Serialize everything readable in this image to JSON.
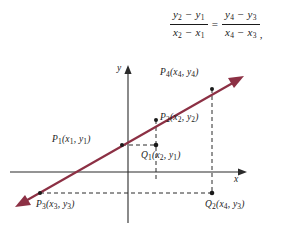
{
  "formula": {
    "left": {
      "numerator": "y2 − y1",
      "denominator": "x2 − x1",
      "num_v1": "y",
      "num_s1": "2",
      "num_op": "−",
      "num_v2": "y",
      "num_s2": "1",
      "den_v1": "x",
      "den_s1": "2",
      "den_op": "−",
      "den_v2": "x",
      "den_s2": "1"
    },
    "equals": "=",
    "right": {
      "numerator": "y4 − y3",
      "denominator": "x4 − x3",
      "num_v1": "y",
      "num_s1": "4",
      "num_op": "−",
      "num_v2": "y",
      "num_s2": "3",
      "den_v1": "x",
      "den_s1": "4",
      "den_op": "−",
      "den_v2": "x",
      "den_s2": "3"
    },
    "trailing_punctuation": ","
  },
  "axes": {
    "x_label": "x",
    "y_label": "y"
  },
  "points": [
    {
      "id": "P1",
      "name": "P",
      "index": "1",
      "coords_open": "(",
      "cx": "x",
      "cx_sub": "1",
      "comma": ",",
      "cy": "y",
      "cy_sub": "1",
      "coords_close": ")"
    },
    {
      "id": "P2",
      "name": "P",
      "index": "2",
      "coords_open": "(",
      "cx": "x",
      "cx_sub": "2",
      "comma": ",",
      "cy": "y",
      "cy_sub": "2",
      "coords_close": ")"
    },
    {
      "id": "P3",
      "name": "P",
      "index": "3",
      "coords_open": "(",
      "cx": "x",
      "cx_sub": "3",
      "comma": ",",
      "cy": "y",
      "cy_sub": "3",
      "coords_close": ")"
    },
    {
      "id": "P4",
      "name": "P",
      "index": "4",
      "coords_open": "(",
      "cx": "x",
      "cx_sub": "4",
      "comma": ",",
      "cy": "y",
      "cy_sub": "4",
      "coords_close": ")"
    },
    {
      "id": "Q1",
      "name": "Q",
      "index": "1",
      "coords_open": "(",
      "cx": "x",
      "cx_sub": "2",
      "comma": ",",
      "cy": "y",
      "cy_sub": "1",
      "coords_close": ")"
    },
    {
      "id": "Q2",
      "name": "Q",
      "index": "2",
      "coords_open": "(",
      "cx": "x",
      "cx_sub": "4",
      "comma": ",",
      "cy": "y",
      "cy_sub": "3",
      "coords_close": ")"
    }
  ],
  "colors": {
    "line": "#8c3044",
    "axis": "#2b2b2b",
    "dashed": "#2b2b2b",
    "text": "#1a1a1a",
    "background": "#ffffff"
  }
}
